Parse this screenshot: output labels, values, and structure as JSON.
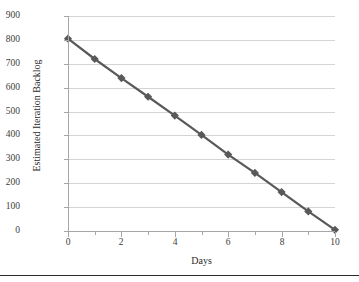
{
  "chart_data": {
    "type": "line",
    "title": "",
    "xlabel": "Days",
    "ylabel": "Estimated Iteration Backlog",
    "xlim": [
      0,
      10
    ],
    "ylim": [
      0,
      900
    ],
    "grid": "horizontal",
    "legend": "none",
    "marker": "diamond",
    "line_color": "#595959",
    "marker_color": "#595959",
    "gridline_color": "#d4d4d4",
    "axis_color": "#a6a6a6",
    "x": [
      0,
      1,
      2,
      3,
      4,
      5,
      6,
      7,
      8,
      9,
      10
    ],
    "values": [
      805,
      720,
      640,
      562,
      483,
      402,
      320,
      243,
      163,
      82,
      5
    ],
    "series": [
      {
        "name": "Estimated Iteration Backlog",
        "values": [
          805,
          720,
          640,
          562,
          483,
          402,
          320,
          243,
          163,
          82,
          5
        ]
      }
    ],
    "y_ticks": [
      0,
      100,
      200,
      300,
      400,
      500,
      600,
      700,
      800,
      900
    ],
    "y_tick_labels": [
      "0",
      "100",
      "200",
      "300",
      "400",
      "500",
      "600",
      "700",
      "800",
      "900"
    ],
    "x_ticks": [
      0,
      1,
      2,
      3,
      4,
      5,
      6,
      7,
      8,
      9,
      10
    ],
    "x_tick_labels": [
      "0",
      "",
      "2",
      "",
      "4",
      "",
      "6",
      "",
      "8",
      "",
      "10"
    ],
    "x_major_ticks": [
      0,
      2,
      4,
      6,
      8,
      10
    ]
  }
}
